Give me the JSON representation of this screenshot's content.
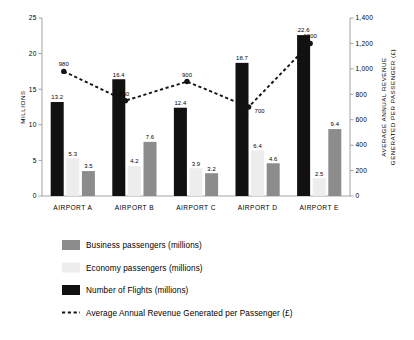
{
  "chart_data": {
    "type": "bar",
    "title": "",
    "subtitle": "",
    "categories": [
      "AIRPORT A",
      "AIRPORT B",
      "AIRPORT C",
      "AIRPORT D",
      "AIRPORT E"
    ],
    "xlabel": "",
    "ylabel": "MILLIONS",
    "ylabel_right": "AVERAGE ANNUAL REVENUE GENERATED PER PASSENGER (£)",
    "ylim": [
      0,
      25
    ],
    "ylim_right": [
      0,
      1400
    ],
    "yticks": [
      "0",
      "5",
      "10",
      "15",
      "20",
      "25"
    ],
    "ytick_values": [
      0,
      5,
      10,
      15,
      20,
      25
    ],
    "yticks_right": [
      "0",
      "200",
      "400",
      "600",
      "800",
      "1,000",
      "1,200",
      "1,400"
    ],
    "ytick_values_right": [
      0,
      200,
      400,
      600,
      800,
      1000,
      1200,
      1400
    ],
    "grid": false,
    "legend_position": "bottom-left",
    "series": [
      {
        "name": "Number of Flights (millions)",
        "kind": "bar",
        "axis": "left",
        "color": "#111111",
        "values": [
          13.2,
          16.4,
          12.4,
          18.7,
          22.6
        ],
        "labels": [
          "13.2",
          "16.4",
          "12.4",
          "18.7",
          "22.6"
        ]
      },
      {
        "name": "Economy passengers (millions)",
        "kind": "bar",
        "axis": "left",
        "color": "#ededed",
        "values": [
          5.3,
          4.2,
          3.9,
          6.4,
          2.5
        ],
        "labels": [
          "5.3",
          "4.2",
          "3.9",
          "6.4",
          "2.5"
        ]
      },
      {
        "name": "Business passengers (millions)",
        "kind": "bar",
        "axis": "left",
        "color": "#8c8c8c",
        "values": [
          3.5,
          7.6,
          3.2,
          4.6,
          9.4
        ],
        "labels": [
          "3.5",
          "7.6",
          "3.2",
          "4.6",
          "9.4"
        ]
      },
      {
        "name": "Average Annual Revenue Generated per Passenger (£)",
        "kind": "line",
        "axis": "right",
        "color": "#141414",
        "style": "dashed",
        "marker": "circle",
        "values": [
          980,
          750,
          900,
          700,
          1200
        ],
        "labels": [
          "980",
          "750",
          "900",
          "700",
          "1200"
        ]
      }
    ]
  },
  "legend": {
    "items": [
      {
        "label": "Business passengers (millions)",
        "swatch": "#8c8c8c",
        "type": "swatch"
      },
      {
        "label": "Economy passengers (millions)",
        "swatch": "#ededed",
        "type": "swatch"
      },
      {
        "label": "Number of Flights (millions)",
        "swatch": "#111111",
        "type": "swatch"
      },
      {
        "label": "Average Annual Revenue Generated per Passenger (£)",
        "swatch": "#141414",
        "type": "dashed-line"
      }
    ]
  }
}
